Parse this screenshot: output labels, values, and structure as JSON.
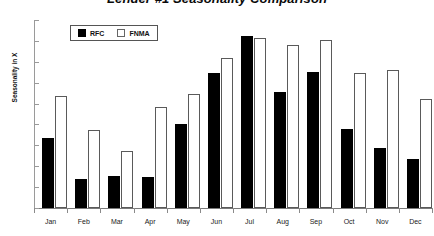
{
  "chart_data": {
    "type": "bar",
    "title": "Lender #1 Seasonality Comparison",
    "xlabel": "",
    "ylabel": "Seasonality in X",
    "ylim": [
      0,
      0.9
    ],
    "ytick_labels": [
      "0.9",
      "0.8",
      "0.7",
      "0.6",
      "0.5",
      "0.4",
      "0.3",
      "0.2",
      "0.1",
      "0"
    ],
    "ytick_values": [
      0.9,
      0.8,
      0.7,
      0.6,
      0.5,
      0.4,
      0.3,
      0.2,
      0.1,
      0
    ],
    "grid": false,
    "legend_position": "upper-left-inside",
    "categories": [
      "Jan",
      "Feb",
      "Mar",
      "Apr",
      "May",
      "Jun",
      "Jul",
      "Aug",
      "Sep",
      "Oct",
      "Nov",
      "Dec"
    ],
    "series": [
      {
        "name": "RFC",
        "color": "#000000",
        "values": [
          0.335,
          0.14,
          0.155,
          0.15,
          0.4,
          0.645,
          0.825,
          0.555,
          0.65,
          0.38,
          0.285,
          0.235
        ]
      },
      {
        "name": "FNMA",
        "color": "#ffffff",
        "values": [
          0.535,
          0.375,
          0.275,
          0.485,
          0.545,
          0.72,
          0.815,
          0.78,
          0.805,
          0.645,
          0.66,
          0.52
        ]
      }
    ]
  },
  "legend": {
    "items": [
      {
        "label": "RFC"
      },
      {
        "label": "FNMA"
      }
    ]
  }
}
